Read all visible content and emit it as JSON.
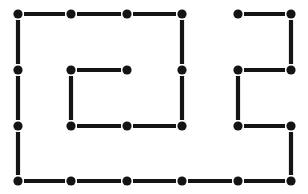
{
  "figure": {
    "background_color": "#ffffff",
    "ink_color": "#141414",
    "width": 308,
    "height": 194
  },
  "lattice": {
    "columns": 6,
    "rows": 4,
    "column_x": [
      18,
      71,
      127,
      182,
      238,
      291
    ],
    "row_y": [
      14,
      70,
      126,
      181
    ],
    "node_radius": 4.6,
    "edge_width": 4.2,
    "edge_gap": 6,
    "nodes": [
      {
        "col": 0,
        "row": 0
      },
      {
        "col": 1,
        "row": 0
      },
      {
        "col": 2,
        "row": 0
      },
      {
        "col": 3,
        "row": 0
      },
      {
        "col": 4,
        "row": 0
      },
      {
        "col": 5,
        "row": 0
      },
      {
        "col": 0,
        "row": 1
      },
      {
        "col": 1,
        "row": 1
      },
      {
        "col": 2,
        "row": 1
      },
      {
        "col": 3,
        "row": 1
      },
      {
        "col": 4,
        "row": 1
      },
      {
        "col": 5,
        "row": 1
      },
      {
        "col": 0,
        "row": 2
      },
      {
        "col": 1,
        "row": 2
      },
      {
        "col": 2,
        "row": 2
      },
      {
        "col": 3,
        "row": 2
      },
      {
        "col": 4,
        "row": 2
      },
      {
        "col": 5,
        "row": 2
      },
      {
        "col": 0,
        "row": 3
      },
      {
        "col": 1,
        "row": 3
      },
      {
        "col": 2,
        "row": 3
      },
      {
        "col": 3,
        "row": 3
      },
      {
        "col": 4,
        "row": 3
      },
      {
        "col": 5,
        "row": 3
      }
    ],
    "horizontal_edges": [
      {
        "row": 0,
        "col": 0
      },
      {
        "row": 0,
        "col": 1
      },
      {
        "row": 0,
        "col": 2
      },
      {
        "row": 0,
        "col": 4
      },
      {
        "row": 1,
        "col": 1
      },
      {
        "row": 1,
        "col": 4
      },
      {
        "row": 2,
        "col": 1
      },
      {
        "row": 2,
        "col": 2
      },
      {
        "row": 2,
        "col": 4
      },
      {
        "row": 3,
        "col": 0
      },
      {
        "row": 3,
        "col": 1
      },
      {
        "row": 3,
        "col": 2
      },
      {
        "row": 3,
        "col": 3
      },
      {
        "row": 3,
        "col": 4
      }
    ],
    "vertical_edges": [
      {
        "col": 0,
        "row": 0
      },
      {
        "col": 0,
        "row": 1
      },
      {
        "col": 0,
        "row": 2
      },
      {
        "col": 1,
        "row": 1
      },
      {
        "col": 3,
        "row": 0
      },
      {
        "col": 3,
        "row": 1
      },
      {
        "col": 4,
        "row": 1
      },
      {
        "col": 5,
        "row": 0
      },
      {
        "col": 5,
        "row": 2
      }
    ]
  }
}
